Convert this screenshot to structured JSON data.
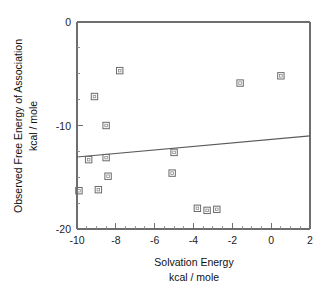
{
  "chart_data": {
    "type": "scatter",
    "title": "",
    "xlabel": "Solvation Energy",
    "xlabel_units": "kcal / mole",
    "ylabel": "Observed Free Energy of Association",
    "ylabel_units": "kcal / mole",
    "xlim": [
      -10,
      2
    ],
    "ylim": [
      -20,
      0
    ],
    "xticks": [
      -10,
      -8,
      -6,
      -4,
      -2,
      0,
      2
    ],
    "xtick_labels": [
      "-10",
      "-8",
      "-6",
      "-4",
      "-2",
      "0",
      "2"
    ],
    "yticks": [
      0,
      -10,
      -20
    ],
    "ytick_labels": [
      "0",
      "-10",
      "-20"
    ],
    "x_minor_tick_step": 0.5,
    "y_minor_tick_step": 2.5,
    "grid": false,
    "legend": false,
    "marker_style": "open-square",
    "points": [
      {
        "x": -7.8,
        "y": -4.7
      },
      {
        "x": -9.1,
        "y": -7.2
      },
      {
        "x": -8.5,
        "y": -10.0
      },
      {
        "x": -1.6,
        "y": -5.9
      },
      {
        "x": 0.5,
        "y": -5.2
      },
      {
        "x": -5.0,
        "y": -12.6
      },
      {
        "x": -5.1,
        "y": -14.6
      },
      {
        "x": -9.4,
        "y": -13.3
      },
      {
        "x": -8.5,
        "y": -13.1
      },
      {
        "x": -8.4,
        "y": -14.9
      },
      {
        "x": -8.9,
        "y": -16.2
      },
      {
        "x": -9.9,
        "y": -16.3
      },
      {
        "x": -3.8,
        "y": -18.0
      },
      {
        "x": -3.3,
        "y": -18.2
      },
      {
        "x": -2.8,
        "y": -18.1
      }
    ],
    "trendline": {
      "type": "linear-fit",
      "x_start": -10,
      "y_start": -13.05,
      "x_end": 2,
      "y_end": -11.0
    },
    "colors": {
      "axis": "#6e6e6e",
      "marker": "#6b6b6b",
      "trendline": "#5a5a5a",
      "text": "#111111",
      "background": "#ffffff"
    }
  }
}
